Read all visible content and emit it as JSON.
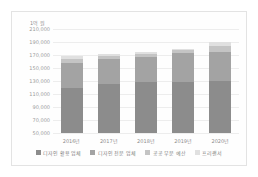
{
  "chart_data": {
    "type": "bar",
    "stacked": true,
    "title": "",
    "unit_label": "1억 원",
    "xlabel": "",
    "ylabel": "",
    "grid": true,
    "legend_position": "bottom",
    "categories": [
      "2016년",
      "2017년",
      "2018년",
      "2019년",
      "2020년"
    ],
    "ylim": [
      50000,
      210000
    ],
    "yticks": [
      210000,
      190000,
      170000,
      150000,
      130000,
      110000,
      90000,
      70000,
      50000
    ],
    "ytick_labels": [
      "210,000",
      "190,000",
      "170,000",
      "150,000",
      "130,000",
      "110,000",
      "90,000",
      "70,000",
      "50,000"
    ],
    "series": [
      {
        "name": "디자인 활용 업체",
        "color": "#8c8c8c",
        "values": [
          120000,
          126000,
          128000,
          129000,
          130000
        ]
      },
      {
        "name": "디자인 전문 업체",
        "color": "#a3a3a3",
        "values": [
          38000,
          38000,
          39000,
          44000,
          45000
        ]
      },
      {
        "name": "공공 부문 예산",
        "color": "#c4c4c4",
        "values": [
          6000,
          5000,
          5000,
          4000,
          9000
        ]
      },
      {
        "name": "프리랜서",
        "color": "#e0e0e0",
        "values": [
          4000,
          3000,
          3000,
          3000,
          6000
        ]
      }
    ],
    "totals": [
      168000,
      172000,
      175000,
      180000,
      190000
    ]
  }
}
